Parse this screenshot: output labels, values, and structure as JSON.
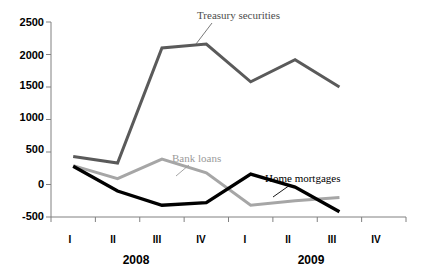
{
  "chart_data": {
    "type": "line",
    "title": "",
    "xlabel": "",
    "ylabel": "",
    "ylim": [
      -500,
      2500
    ],
    "yticks": [
      2500,
      2000,
      1500,
      1000,
      500,
      0,
      -500
    ],
    "ytick_labels": [
      "2500",
      "2000",
      "1500",
      "1000",
      "500",
      "0",
      "-500"
    ],
    "grid": false,
    "legend_position": "inline-annotations",
    "categories": [
      "I",
      "II",
      "III",
      "IV",
      "I",
      "II",
      "III",
      "IV"
    ],
    "x_group_labels": [
      "2008",
      "2009"
    ],
    "series": [
      {
        "name": "Treasury securities",
        "color": "#5a5a5a",
        "values": [
          430,
          330,
          2100,
          2160,
          1580,
          1920,
          1500,
          null
        ]
      },
      {
        "name": "Bank loans",
        "color": "#a6a6a6",
        "values": [
          290,
          90,
          390,
          180,
          -320,
          -250,
          -200,
          null
        ]
      },
      {
        "name": "Home mortgages",
        "color": "#000000",
        "values": [
          280,
          -100,
          -320,
          -280,
          160,
          -40,
          -420,
          null
        ]
      }
    ],
    "annotations": [
      {
        "text": "Treasury securities",
        "series": "Treasury securities"
      },
      {
        "text": "Bank loans",
        "series": "Bank loans"
      },
      {
        "text": "Home mortgages",
        "series": "Home mortgages"
      }
    ]
  },
  "axis": {
    "y_ticks": [
      {
        "label": "2500"
      },
      {
        "label": "2000"
      },
      {
        "label": "1500"
      },
      {
        "label": "1000"
      },
      {
        "label": "500"
      },
      {
        "label": "0"
      },
      {
        "label": "-500"
      }
    ],
    "x_ticks": [
      {
        "label": "I"
      },
      {
        "label": "II"
      },
      {
        "label": "III"
      },
      {
        "label": "IV"
      },
      {
        "label": "I"
      },
      {
        "label": "II"
      },
      {
        "label": "III"
      },
      {
        "label": "IV"
      }
    ],
    "years": [
      {
        "label": "2008"
      },
      {
        "label": "2009"
      }
    ]
  },
  "labels": {
    "treasury": "Treasury securities",
    "bank_loans": "Bank loans",
    "home_mortgages": "Home mortgages"
  },
  "colors": {
    "treasury": "#5a5a5a",
    "bank_loans": "#a6a6a6",
    "home_mortgages": "#000000",
    "axis": "#808080"
  }
}
